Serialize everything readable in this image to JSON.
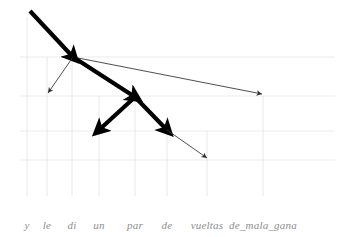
{
  "figure": {
    "title": "",
    "type": "dependency-arc-diagram",
    "width": 341,
    "height": 237,
    "background_color": "#ffffff",
    "gridline_color": "#e2e2e2",
    "thick_edge_color": "#000000",
    "thin_edge_color": "#3a3a3a",
    "label_color": "#8e8e8e"
  },
  "tokens": [
    {
      "label": "y",
      "x": 27,
      "tick_top": 17,
      "tick_bottom": 196
    },
    {
      "label": "le",
      "x": 47,
      "tick_top": 57,
      "tick_bottom": 196
    },
    {
      "label": "di",
      "x": 72,
      "tick_top": 57,
      "tick_bottom": 196
    },
    {
      "label": "un",
      "x": 99,
      "tick_top": 96,
      "tick_bottom": 196
    },
    {
      "label": "par",
      "x": 135,
      "tick_top": 96,
      "tick_bottom": 196
    },
    {
      "label": "de",
      "x": 167,
      "tick_top": 131,
      "tick_bottom": 196
    },
    {
      "label": "vueltas",
      "x": 207,
      "tick_top": 131,
      "tick_bottom": 196
    },
    {
      "label": "de_mala_gana",
      "x": 263,
      "tick_top": 96,
      "tick_bottom": 196
    }
  ],
  "label_row_y": 219,
  "horizontal_gridlines": [
    {
      "y": 57,
      "x1": 20,
      "x2": 335
    },
    {
      "y": 96,
      "x1": 20,
      "x2": 335
    },
    {
      "y": 131,
      "x1": 20,
      "x2": 335
    },
    {
      "y": 160,
      "x1": 20,
      "x2": 335
    }
  ],
  "edges": [
    {
      "name": "edge-y-to-di",
      "from": "y",
      "to": "di",
      "x1": 30,
      "y1": 11,
      "x2": 73,
      "y2": 57,
      "weight": "thick"
    },
    {
      "name": "edge-di-to-le",
      "from": "di",
      "to": "le",
      "x1": 73,
      "y1": 57,
      "x2": 48,
      "y2": 93,
      "weight": "thin"
    },
    {
      "name": "edge-di-to-de-mala-gana",
      "from": "di",
      "to": "de_mala_gana",
      "x1": 73,
      "y1": 57,
      "x2": 262,
      "y2": 94,
      "weight": "thin"
    },
    {
      "name": "edge-di-to-par",
      "from": "di",
      "to": "par",
      "x1": 73,
      "y1": 57,
      "x2": 135,
      "y2": 97,
      "weight": "thick"
    },
    {
      "name": "edge-par-to-un",
      "from": "par",
      "to": "un",
      "x1": 135,
      "y1": 97,
      "x2": 99,
      "y2": 130,
      "weight": "thick"
    },
    {
      "name": "edge-par-to-de",
      "from": "par",
      "to": "de",
      "x1": 135,
      "y1": 97,
      "x2": 167,
      "y2": 130,
      "weight": "thick"
    },
    {
      "name": "edge-de-to-vueltas",
      "from": "de",
      "to": "vueltas",
      "x1": 167,
      "y1": 130,
      "x2": 207,
      "y2": 158,
      "weight": "thin"
    }
  ],
  "chart_data": {
    "type": "diagram",
    "title": "",
    "xlabel": "",
    "ylabel": "",
    "categories": [
      "y",
      "le",
      "di",
      "un",
      "par",
      "de",
      "vueltas",
      "de_mala_gana"
    ],
    "sentence": "y le di un par de vueltas de_mala_gana",
    "arcs": [
      {
        "head": "y",
        "dependent": "di",
        "strength": "thick"
      },
      {
        "head": "di",
        "dependent": "le",
        "strength": "thin"
      },
      {
        "head": "di",
        "dependent": "de_mala_gana",
        "strength": "thin"
      },
      {
        "head": "di",
        "dependent": "par",
        "strength": "thick"
      },
      {
        "head": "par",
        "dependent": "un",
        "strength": "thick"
      },
      {
        "head": "par",
        "dependent": "de",
        "strength": "thick"
      },
      {
        "head": "de",
        "dependent": "vueltas",
        "strength": "thin"
      }
    ],
    "grid": true,
    "legend": "none"
  }
}
